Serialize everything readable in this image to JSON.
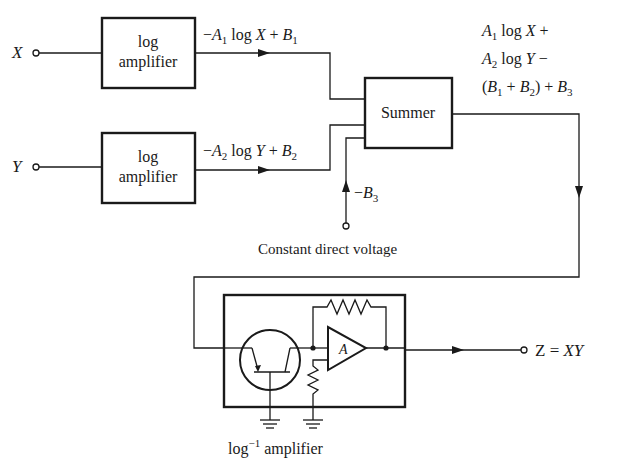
{
  "diagram": {
    "inputs": [
      {
        "id": "x",
        "label": "X"
      },
      {
        "id": "y",
        "label": "Y"
      }
    ],
    "blocks": {
      "log_amp_1": {
        "line1": "log",
        "line2": "amplifier"
      },
      "log_amp_2": {
        "line1": "log",
        "line2": "amplifier"
      },
      "summer": {
        "label": "Summer"
      },
      "antilog_amp": {
        "label_main": "log",
        "label_sup": "−1",
        "label_rest": " amplifier",
        "opamp_label": "A"
      }
    },
    "signals": {
      "log_x_out": {
        "parts": [
          "−",
          "A",
          "1",
          " log ",
          "X",
          " + ",
          "B",
          "1"
        ]
      },
      "log_y_out": {
        "parts": [
          "−",
          "A",
          "2",
          " log ",
          "Y",
          " + ",
          "B",
          "2"
        ]
      },
      "constant": {
        "minus": "−",
        "B": "B",
        "sub": "3"
      },
      "constant_label": "Constant direct voltage",
      "summer_out": {
        "line1": {
          "A": "A",
          "sub": "1",
          "rest": " log ",
          "var": "X",
          "op": " +"
        },
        "line2": {
          "A": "A",
          "sub": "2",
          "rest": " log ",
          "var": "Y",
          "op": " −"
        },
        "line3": {
          "open": "(",
          "B1": "B",
          "sub1": "1",
          "plus": " + ",
          "B2": "B",
          "sub2": "2",
          "close": ") + ",
          "B3": "B",
          "sub3": "3"
        }
      }
    },
    "output": {
      "lhs": "Z",
      "eq": " = ",
      "rhs": "XY"
    }
  }
}
